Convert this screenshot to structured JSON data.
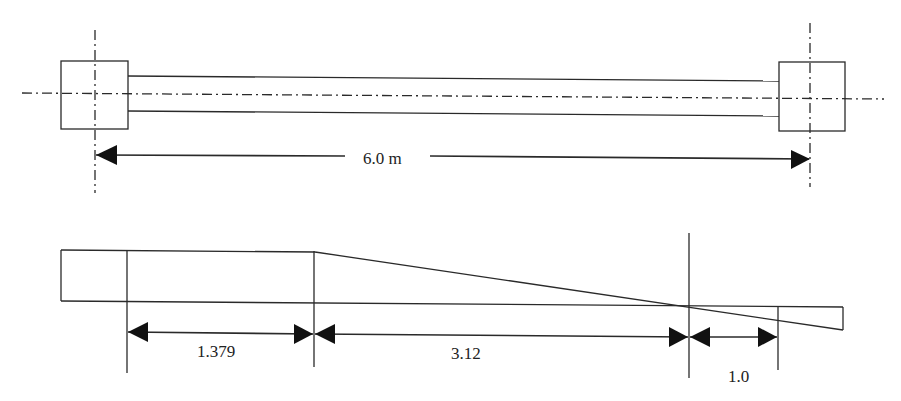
{
  "colors": {
    "stroke": "#2a2a2a",
    "background": "#ffffff"
  },
  "plan_view": {
    "span_label": "6.0 m",
    "left_support": "column-square",
    "right_support": "column-square"
  },
  "section_view": {
    "dimensions": [
      {
        "label": "1.379"
      },
      {
        "label": "3.12"
      },
      {
        "label": "1.0"
      }
    ]
  }
}
